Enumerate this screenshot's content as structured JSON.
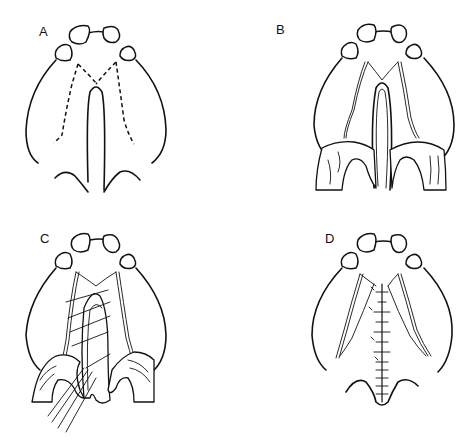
{
  "figure": {
    "panels": [
      {
        "id": "A",
        "label": "A",
        "stage": "incision-outline"
      },
      {
        "id": "B",
        "label": "B",
        "stage": "flaps-elevated"
      },
      {
        "id": "C",
        "label": "C",
        "stage": "nasal-layer-suturing"
      },
      {
        "id": "D",
        "label": "D",
        "stage": "closure-complete"
      }
    ]
  }
}
